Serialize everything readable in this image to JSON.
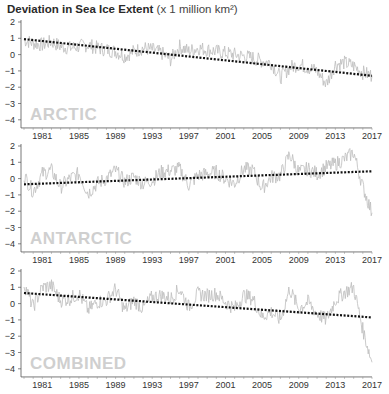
{
  "title": {
    "bold": "Deviation in Sea Ice Extent",
    "unit": "(x 1 million km²)"
  },
  "chart_data": [
    {
      "type": "line",
      "title": "ARCTIC",
      "xlabel": "",
      "ylabel": "Deviation in Sea Ice Extent (x 1 million km²)",
      "x_ticks": [
        "1981",
        "1985",
        "1989",
        "1993",
        "1997",
        "2001",
        "2005",
        "2009",
        "2013",
        "2017"
      ],
      "y_ticks": [
        2,
        1,
        0,
        -1,
        -2,
        -3,
        -4
      ],
      "ylim": [
        -4.5,
        2
      ],
      "xlim": [
        1979,
        2017
      ],
      "series": [
        {
          "name": "monthly deviation",
          "x": [
            1979,
            1980,
            1981,
            1982,
            1983,
            1984,
            1985,
            1986,
            1987,
            1988,
            1989,
            1990,
            1991,
            1992,
            1993,
            1994,
            1995,
            1996,
            1997,
            1998,
            1999,
            2000,
            2001,
            2002,
            2003,
            2004,
            2005,
            2006,
            2007,
            2008,
            2009,
            2010,
            2011,
            2012,
            2013,
            2014,
            2015,
            2016,
            2017
          ],
          "values": [
            0.9,
            0.7,
            0.6,
            0.8,
            0.5,
            0.4,
            0.5,
            0.6,
            0.4,
            0.3,
            0.2,
            -0.1,
            0.2,
            0.4,
            0.3,
            0.1,
            -0.3,
            0.5,
            0.2,
            0.4,
            0.3,
            0.2,
            0.1,
            0.0,
            -0.1,
            -0.2,
            -0.4,
            -0.5,
            -1.4,
            -0.8,
            -0.6,
            -0.8,
            -1.0,
            -1.8,
            -0.6,
            -0.5,
            -0.7,
            -1.1,
            -1.3
          ]
        },
        {
          "name": "trend",
          "x": [
            1979,
            2017
          ],
          "values": [
            0.95,
            -1.3
          ]
        }
      ]
    },
    {
      "type": "line",
      "title": "ANTARCTIC",
      "x_ticks": [
        "1981",
        "1985",
        "1989",
        "1993",
        "1997",
        "2001",
        "2005",
        "2009",
        "2013",
        "2017"
      ],
      "y_ticks": [
        2,
        1,
        0,
        -1,
        -2,
        -3,
        -4
      ],
      "ylim": [
        -4.5,
        2
      ],
      "xlim": [
        1979,
        2017
      ],
      "series": [
        {
          "name": "monthly deviation",
          "x": [
            1979,
            1980,
            1981,
            1982,
            1983,
            1984,
            1985,
            1986,
            1987,
            1988,
            1989,
            1990,
            1991,
            1992,
            1993,
            1994,
            1995,
            1996,
            1997,
            1998,
            1999,
            2000,
            2001,
            2002,
            2003,
            2004,
            2005,
            2006,
            2007,
            2008,
            2009,
            2010,
            2011,
            2012,
            2013,
            2014,
            2015,
            2016,
            2017
          ],
          "values": [
            0.2,
            -0.8,
            0.3,
            0.5,
            -0.5,
            0.0,
            0.3,
            -0.9,
            -0.3,
            0.0,
            0.5,
            -0.2,
            0.1,
            -0.3,
            -0.1,
            0.4,
            0.5,
            0.6,
            -0.4,
            0.2,
            0.3,
            0.4,
            0.0,
            -0.3,
            0.6,
            0.5,
            -0.6,
            0.1,
            0.2,
            1.5,
            0.4,
            0.6,
            0.3,
            0.7,
            0.9,
            1.2,
            1.6,
            -0.5,
            -2.1
          ]
        },
        {
          "name": "trend",
          "x": [
            1979,
            2017
          ],
          "values": [
            -0.35,
            0.45
          ]
        }
      ]
    },
    {
      "type": "line",
      "title": "COMBINED",
      "x_ticks": [
        "1981",
        "1985",
        "1989",
        "1993",
        "1997",
        "2001",
        "2005",
        "2009",
        "2013",
        "2017"
      ],
      "y_ticks": [
        2,
        1,
        0,
        -1,
        -2,
        -3,
        -4
      ],
      "ylim": [
        -4.5,
        2
      ],
      "xlim": [
        1979,
        2017
      ],
      "series": [
        {
          "name": "monthly deviation",
          "x": [
            1979,
            1980,
            1981,
            1982,
            1983,
            1984,
            1985,
            1986,
            1987,
            1988,
            1989,
            1990,
            1991,
            1992,
            1993,
            1994,
            1995,
            1996,
            1997,
            1998,
            1999,
            2000,
            2001,
            2002,
            2003,
            2004,
            2005,
            2006,
            2007,
            2008,
            2009,
            2010,
            2011,
            2012,
            2013,
            2014,
            2015,
            2016,
            2017
          ],
          "values": [
            1.2,
            -0.2,
            1.0,
            1.1,
            0.2,
            0.3,
            0.6,
            -0.4,
            0.1,
            0.2,
            0.9,
            -0.4,
            0.2,
            -0.3,
            0.4,
            0.5,
            0.3,
            0.9,
            -0.2,
            0.6,
            0.5,
            0.6,
            0.1,
            -0.3,
            0.5,
            0.3,
            -0.8,
            -0.5,
            -1.0,
            0.9,
            -0.3,
            0.1,
            -0.6,
            -1.0,
            0.2,
            0.7,
            1.0,
            -1.6,
            -3.6
          ]
        },
        {
          "name": "trend",
          "x": [
            1979,
            2017
          ],
          "values": [
            0.65,
            -0.85
          ]
        }
      ]
    }
  ],
  "panels": {
    "labels": [
      "ARCTIC",
      "ANTARCTIC",
      "COMBINED"
    ]
  }
}
